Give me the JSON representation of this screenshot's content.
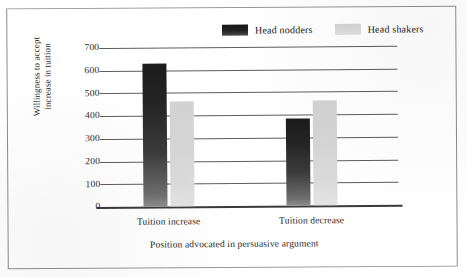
{
  "chart_data": {
    "type": "bar",
    "title": "",
    "categories": [
      "Tuition increase",
      "Tuition decrease"
    ],
    "series": [
      {
        "name": "Head nodders",
        "values": [
          628,
          382
        ],
        "color": "#232323"
      },
      {
        "name": "Head shakers",
        "values": [
          462,
          462
        ],
        "color": "#d8d8d8"
      }
    ],
    "xlabel": "Position advocated in persuasive argument",
    "ylabel": "Willingness to accept increase in tuition",
    "ylabel_line1": "Willingness to accept",
    "ylabel_line2": "increase in tuition",
    "ylim": [
      0,
      700
    ],
    "yticks": [
      700,
      600,
      500,
      400,
      300,
      200,
      100,
      0
    ],
    "ytick_labels": [
      "700",
      "600",
      "500",
      "400",
      "300",
      "200",
      "100",
      "0"
    ],
    "grid": true,
    "grid_axis": "y",
    "legend_position": "top-center",
    "legend_entries": [
      "Head nodders",
      "Head shakers"
    ]
  },
  "figure": {
    "border_color": "#8c8c8c",
    "background": "#ffffff"
  }
}
